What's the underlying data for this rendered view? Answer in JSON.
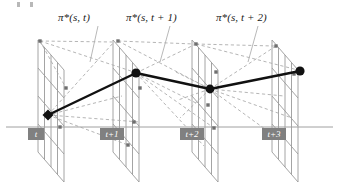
{
  "figure": {
    "background_color": "#ffffff",
    "width": 339,
    "height": 185
  },
  "colors": {
    "grid_line": "#9a9a9a",
    "dashed_line": "#a8a8a8",
    "axis_line": "#a0a0a0",
    "path_line": "#111111",
    "node_fill": "#111111",
    "label_box": "#808080",
    "label_text": "#ffffff",
    "leader_line": "#b0b0b0",
    "policy_text": "#1a1a1a"
  },
  "policy_labels": [
    {
      "text": "π*(s, t)",
      "x": 58,
      "y": 11
    },
    {
      "text": "π*(s, t + 1)",
      "x": 126,
      "y": 11
    },
    {
      "text": "π*(s, t + 2)",
      "x": 216,
      "y": 11
    }
  ],
  "leader_lines": [
    {
      "x1": 98,
      "y1": 26,
      "x2": 90,
      "y2": 62
    },
    {
      "x1": 170,
      "y1": 26,
      "x2": 160,
      "y2": 62
    },
    {
      "x1": 258,
      "y1": 26,
      "x2": 248,
      "y2": 62
    }
  ],
  "time_labels": [
    {
      "text": "t",
      "x": 28,
      "y": 128,
      "w": 16
    },
    {
      "text": "t+1",
      "x": 100,
      "y": 128,
      "w": 24
    },
    {
      "text": "t+2",
      "x": 180,
      "y": 128,
      "w": 24
    },
    {
      "text": "t+3",
      "x": 262,
      "y": 128,
      "w": 24
    }
  ],
  "axis": {
    "x1": 6,
    "y1": 127,
    "x2": 333,
    "y2": 127
  },
  "planes": [
    {
      "name": "plane-t",
      "ox": 38,
      "top": 40,
      "height": 112,
      "width": 34,
      "skew_x": 26,
      "skew_y": 30,
      "cols": 4,
      "rows": 4
    },
    {
      "name": "plane-t1",
      "ox": 113,
      "top": 40,
      "height": 112,
      "width": 34,
      "skew_x": 26,
      "skew_y": 30,
      "cols": 4,
      "rows": 4
    },
    {
      "name": "plane-t2",
      "ox": 192,
      "top": 40,
      "height": 112,
      "width": 34,
      "skew_x": 26,
      "skew_y": 30,
      "cols": 4,
      "rows": 4
    },
    {
      "name": "plane-t3",
      "ox": 272,
      "top": 40,
      "height": 112,
      "width": 34,
      "skew_x": 26,
      "skew_y": 30,
      "cols": 4,
      "rows": 4
    }
  ],
  "trajectory": {
    "type": "optimal-policy-path",
    "nodes": [
      {
        "label": "state at t",
        "x": 48,
        "y": 115,
        "shape": "diamond",
        "size": 5.5
      },
      {
        "label": "state at t+1",
        "x": 136,
        "y": 73,
        "shape": "circle",
        "size": 4.6
      },
      {
        "label": "state at t+2",
        "x": 210,
        "y": 89,
        "shape": "circle",
        "size": 4.4
      },
      {
        "label": "state at t+3",
        "x": 300,
        "y": 71,
        "shape": "circle",
        "size": 4.6
      }
    ],
    "segments": [
      {
        "from": 0,
        "to": 1
      },
      {
        "from": 1,
        "to": 2
      },
      {
        "from": 2,
        "to": 3
      }
    ]
  },
  "candidate_transitions": [
    {
      "from_x": 48,
      "from_y": 115,
      "to_x": 114,
      "to_y": 42
    },
    {
      "from_x": 48,
      "from_y": 115,
      "to_x": 136,
      "to_y": 73
    },
    {
      "from_x": 48,
      "from_y": 115,
      "to_x": 122,
      "to_y": 96
    },
    {
      "from_x": 48,
      "from_y": 115,
      "to_x": 140,
      "to_y": 122
    },
    {
      "from_x": 48,
      "from_y": 115,
      "to_x": 128,
      "to_y": 145
    },
    {
      "from_x": 40,
      "from_y": 41,
      "to_x": 112,
      "to_y": 42
    },
    {
      "from_x": 40,
      "from_y": 41,
      "to_x": 134,
      "to_y": 72
    },
    {
      "from_x": 40,
      "from_y": 41,
      "to_x": 66,
      "to_y": 88
    },
    {
      "from_x": 136,
      "from_y": 73,
      "to_x": 196,
      "to_y": 44
    },
    {
      "from_x": 136,
      "from_y": 73,
      "to_x": 210,
      "to_y": 89
    },
    {
      "from_x": 136,
      "from_y": 73,
      "to_x": 200,
      "to_y": 105
    },
    {
      "from_x": 136,
      "from_y": 73,
      "to_x": 214,
      "to_y": 128
    },
    {
      "from_x": 136,
      "from_y": 73,
      "to_x": 204,
      "to_y": 146
    },
    {
      "from_x": 118,
      "from_y": 41,
      "to_x": 194,
      "to_y": 44
    },
    {
      "from_x": 118,
      "from_y": 41,
      "to_x": 208,
      "to_y": 88
    },
    {
      "from_x": 210,
      "from_y": 89,
      "to_x": 276,
      "to_y": 46
    },
    {
      "from_x": 210,
      "from_y": 89,
      "to_x": 300,
      "to_y": 71
    },
    {
      "from_x": 210,
      "from_y": 89,
      "to_x": 284,
      "to_y": 96
    },
    {
      "from_x": 210,
      "from_y": 89,
      "to_x": 292,
      "to_y": 118
    },
    {
      "from_x": 210,
      "from_y": 89,
      "to_x": 280,
      "to_y": 140
    },
    {
      "from_x": 196,
      "from_y": 44,
      "to_x": 274,
      "to_y": 46
    },
    {
      "from_x": 196,
      "from_y": 44,
      "to_x": 298,
      "to_y": 70
    },
    {
      "from_x": 210,
      "from_y": 89,
      "to_x": 176,
      "to_y": 72
    },
    {
      "from_x": 210,
      "from_y": 89,
      "to_x": 178,
      "to_y": 100
    },
    {
      "from_x": 210,
      "from_y": 89,
      "to_x": 180,
      "to_y": 118
    }
  ],
  "grid_nodes": [
    {
      "x": 40,
      "y": 41
    },
    {
      "x": 66,
      "y": 88
    },
    {
      "x": 60,
      "y": 127
    },
    {
      "x": 118,
      "y": 41
    },
    {
      "x": 140,
      "y": 88
    },
    {
      "x": 134,
      "y": 122
    },
    {
      "x": 128,
      "y": 145
    },
    {
      "x": 196,
      "y": 44
    },
    {
      "x": 216,
      "y": 72
    },
    {
      "x": 208,
      "y": 105
    },
    {
      "x": 214,
      "y": 128
    },
    {
      "x": 276,
      "y": 46
    },
    {
      "x": 294,
      "y": 74
    }
  ]
}
